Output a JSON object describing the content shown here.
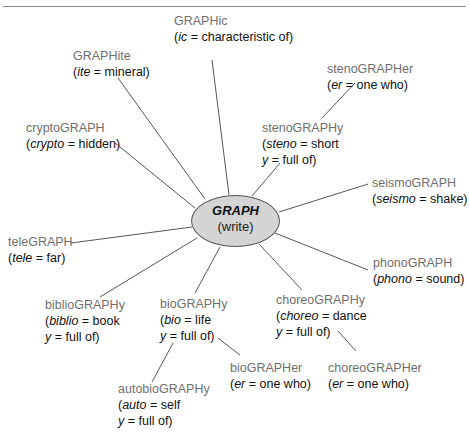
{
  "diagram": {
    "center": {
      "root": "GRAPH",
      "meaning": "(write)"
    },
    "colors": {
      "word": "#6f6f6f",
      "definition": "#111111",
      "ellipse_fill": "#d4d4d4",
      "line": "#444444"
    },
    "nodes": {
      "graphic": {
        "word": "GRAPHic",
        "def": [
          {
            "p": "(",
            "i": "ic",
            "s": " = characteristic of)"
          }
        ]
      },
      "graphite": {
        "word": "GRAPHite",
        "def": [
          {
            "p": "(",
            "i": "ite",
            "s": " = mineral)"
          }
        ]
      },
      "cryptograph": {
        "word": "cryptoGRAPH",
        "def": [
          {
            "p": "(",
            "i": "crypto",
            "s": " = hidden)"
          }
        ]
      },
      "stenographer": {
        "word": "stenoGRAPHer",
        "def": [
          {
            "p": "(",
            "i": "er",
            "s": " = one who)"
          }
        ]
      },
      "stenography": {
        "word": "stenoGRAPHy",
        "def": [
          {
            "p": "(",
            "i": "steno",
            "s": " = short"
          },
          {
            "p": "",
            "i": "y",
            "s": " = full of)"
          }
        ]
      },
      "seismograph": {
        "word": "seismoGRAPH",
        "def": [
          {
            "p": "(",
            "i": "seismo",
            "s": " = shake)"
          }
        ]
      },
      "telegraph": {
        "word": "teleGRAPH",
        "def": [
          {
            "p": "(",
            "i": "tele",
            "s": " = far)"
          }
        ]
      },
      "phonograph": {
        "word": "phonoGRAPH",
        "def": [
          {
            "p": "(",
            "i": "phono",
            "s": " = sound)"
          }
        ]
      },
      "bibliography": {
        "word": "biblioGRAPHy",
        "def": [
          {
            "p": "(",
            "i": "biblio",
            "s": " = book"
          },
          {
            "p": "",
            "i": "y",
            "s": " = full of)"
          }
        ]
      },
      "biography": {
        "word": "bioGRAPHy",
        "def": [
          {
            "p": "(",
            "i": "bio",
            "s": " = life"
          },
          {
            "p": "",
            "i": "y",
            "s": " = full of)"
          }
        ]
      },
      "choreography": {
        "word": "choreoGRAPHy",
        "def": [
          {
            "p": "(",
            "i": "choreo",
            "s": " = dance"
          },
          {
            "p": "",
            "i": "y",
            "s": " = full of)"
          }
        ]
      },
      "biographer": {
        "word": "bioGRAPHer",
        "def": [
          {
            "p": "(",
            "i": "er",
            "s": " = one who)"
          }
        ]
      },
      "choreographer": {
        "word": "choreoGRAPHer",
        "def": [
          {
            "p": "(",
            "i": "er",
            "s": " = one who)"
          }
        ]
      },
      "autobiography": {
        "word": "autobioGRAPHy",
        "def": [
          {
            "p": "(",
            "i": "auto",
            "s": " = self"
          },
          {
            "p": "",
            "i": "y",
            "s": " = full of)"
          }
        ]
      }
    },
    "edges": [
      [
        "center",
        "graphic"
      ],
      [
        "center",
        "graphite"
      ],
      [
        "center",
        "cryptograph"
      ],
      [
        "center",
        "stenography"
      ],
      [
        "stenography",
        "stenographer"
      ],
      [
        "center",
        "seismograph"
      ],
      [
        "center",
        "telegraph"
      ],
      [
        "center",
        "phonograph"
      ],
      [
        "center",
        "bibliography"
      ],
      [
        "center",
        "biography"
      ],
      [
        "center",
        "choreography"
      ],
      [
        "biography",
        "biographer"
      ],
      [
        "biography",
        "autobiography"
      ],
      [
        "choreography",
        "choreographer"
      ]
    ]
  }
}
